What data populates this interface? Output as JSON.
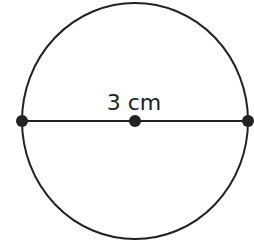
{
  "diagram": {
    "label": "3 cm",
    "shape": "circle",
    "segment": "diameter",
    "points": [
      "left-endpoint",
      "center",
      "right-endpoint"
    ],
    "stroke_color": "#222222"
  }
}
